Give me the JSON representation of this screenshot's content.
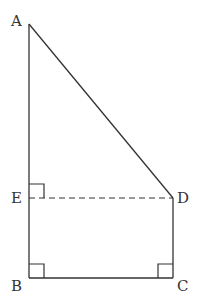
{
  "diagram": {
    "type": "geometry",
    "points": {
      "A": {
        "label": "A",
        "x": 29,
        "y": 24
      },
      "B": {
        "label": "B",
        "x": 29,
        "y": 278
      },
      "C": {
        "label": "C",
        "x": 173,
        "y": 278
      },
      "D": {
        "label": "D",
        "x": 173,
        "y": 198
      },
      "E": {
        "label": "E",
        "x": 29,
        "y": 198
      }
    },
    "segments": [
      {
        "from": "A",
        "to": "B",
        "style": "solid"
      },
      {
        "from": "B",
        "to": "C",
        "style": "solid"
      },
      {
        "from": "C",
        "to": "D",
        "style": "solid"
      },
      {
        "from": "D",
        "to": "A",
        "style": "solid"
      },
      {
        "from": "E",
        "to": "D",
        "style": "dashed"
      }
    ],
    "right_angles": [
      "E",
      "B",
      "C"
    ],
    "color": "#333333"
  }
}
